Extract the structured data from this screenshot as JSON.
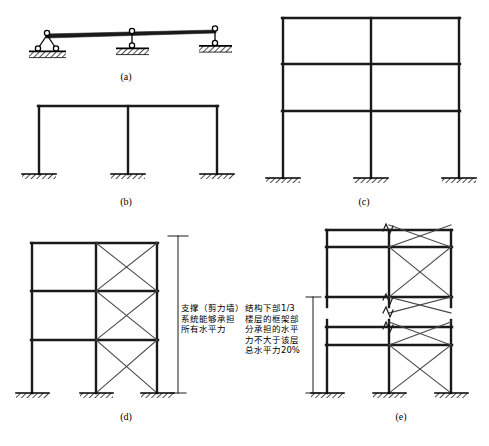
{
  "figure": {
    "panel_count": 5,
    "line_color": "#1a1a1a",
    "hatch_color": "#000000",
    "background": "#ffffff"
  },
  "captions": {
    "a": "(a)",
    "b": "(b)",
    "c": "(c)",
    "d": "(d)",
    "e": "(e)"
  },
  "panels": {
    "a": {
      "name": "pin-roller-supported-beam",
      "description": "simply supported beam on pin and two roller supports",
      "support_count": 3,
      "support_types": [
        "pin",
        "roller",
        "roller"
      ]
    },
    "b": {
      "name": "single-story-two-bay-frame",
      "description": "one story two bay rigid frame with fixed bases",
      "stories": 1,
      "bays": 2,
      "base_type": "fixed"
    },
    "c": {
      "name": "three-story-two-bay-frame",
      "description": "three story two bay moment frame with fixed bases",
      "stories": 3,
      "bays": 2,
      "base_type": "fixed"
    },
    "d": {
      "name": "braced-frame-all-lateral",
      "description": "three story two bay frame with X bracing in right bay",
      "stories": 3,
      "bays": 2,
      "braced_bay": "right",
      "brace_type": "X-brace",
      "base_type": "fixed"
    },
    "e": {
      "name": "tall-braced-frame-partial-lateral",
      "description": "tall braced frame with break symbol, X bracing in right bay",
      "bays": 2,
      "braced_bay": "right",
      "brace_type": "X-brace",
      "break_symbol": true,
      "base_type": "fixed"
    }
  },
  "annotations": {
    "d_note_lines": [
      "支撑（剪力墙）",
      "系统能够承担",
      "所有水平力"
    ],
    "e_note_lines": [
      "结构下部1/3",
      "楼层的框架部",
      "分承担的水平",
      "力不大于该层",
      "总水平力20%"
    ],
    "d_dimension": {
      "name": "full-height-dimension-line",
      "orientation": "vertical",
      "label": ""
    },
    "e_dimension": {
      "name": "lower-third-dimension-line",
      "orientation": "vertical",
      "label": ""
    }
  }
}
